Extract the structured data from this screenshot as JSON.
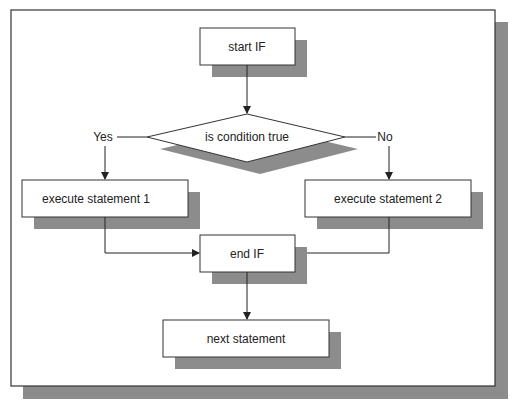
{
  "diagram": {
    "type": "flowchart",
    "colors": {
      "background": "#ffffff",
      "frame_border": "#333333",
      "shadow": "#8c8c8c",
      "box_fill": "#ffffff",
      "line": "#222222"
    },
    "nodes": {
      "start": {
        "label": "start IF",
        "shape": "rectangle"
      },
      "decision": {
        "label": "is condition true",
        "shape": "diamond"
      },
      "exec1": {
        "label": "execute statement 1",
        "shape": "rectangle"
      },
      "exec2": {
        "label": "execute statement 2",
        "shape": "rectangle"
      },
      "end": {
        "label": "end IF",
        "shape": "rectangle"
      },
      "next": {
        "label": "next statement",
        "shape": "rectangle"
      }
    },
    "branch_labels": {
      "yes": "Yes",
      "no": "No"
    },
    "edges": [
      {
        "from": "start",
        "to": "decision"
      },
      {
        "from": "decision",
        "to": "exec1",
        "label": "Yes"
      },
      {
        "from": "decision",
        "to": "exec2",
        "label": "No"
      },
      {
        "from": "exec1",
        "to": "end"
      },
      {
        "from": "exec2",
        "to": "end"
      },
      {
        "from": "end",
        "to": "next"
      }
    ]
  }
}
